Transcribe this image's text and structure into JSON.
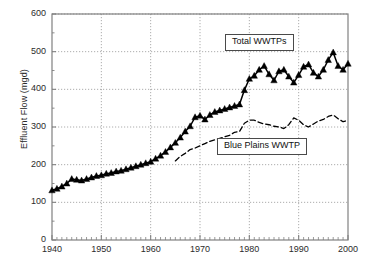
{
  "chart_data": {
    "type": "line",
    "title": "",
    "xlabel": "",
    "ylabel": "Effluent Flow (mgd)",
    "xlim": [
      1940,
      2000
    ],
    "ylim": [
      0,
      600
    ],
    "grid": true,
    "legend_position": "inline-annotations",
    "x_ticks": [
      1940,
      1950,
      1960,
      1970,
      1980,
      1990,
      2000
    ],
    "x_tick_labels": [
      "1940",
      "1950",
      "1960",
      "1970",
      "1980",
      "1990",
      "2000"
    ],
    "x_minor_tick_interval": 1,
    "y_ticks": [
      0,
      100,
      200,
      300,
      400,
      500,
      600
    ],
    "y_tick_labels": [
      "0",
      "100",
      "200",
      "300",
      "400",
      "500",
      "600"
    ],
    "y_minor_tick_interval": 50,
    "series": [
      {
        "name": "Total WWTPs",
        "marker": "filled-triangle",
        "linestyle": "solid",
        "color": "#000000",
        "annotation_label": "Total WWTPs",
        "x": [
          1940,
          1941,
          1942,
          1943,
          1944,
          1945,
          1946,
          1947,
          1948,
          1949,
          1950,
          1951,
          1952,
          1953,
          1954,
          1955,
          1956,
          1957,
          1958,
          1959,
          1960,
          1961,
          1962,
          1963,
          1964,
          1965,
          1966,
          1967,
          1968,
          1969,
          1970,
          1971,
          1972,
          1973,
          1974,
          1975,
          1976,
          1977,
          1978,
          1979,
          1980,
          1981,
          1982,
          1983,
          1984,
          1985,
          1986,
          1987,
          1988,
          1989,
          1990,
          1991,
          1992,
          1993,
          1994,
          1995,
          1996,
          1997,
          1998,
          1999,
          2000
        ],
        "values": [
          132,
          136,
          142,
          150,
          162,
          160,
          158,
          162,
          166,
          170,
          172,
          176,
          178,
          182,
          184,
          188,
          192,
          196,
          200,
          204,
          208,
          216,
          224,
          234,
          246,
          258,
          272,
          288,
          302,
          326,
          330,
          320,
          332,
          340,
          344,
          348,
          352,
          356,
          360,
          398,
          428,
          436,
          452,
          462,
          440,
          424,
          448,
          452,
          434,
          418,
          438,
          460,
          466,
          444,
          434,
          452,
          478,
          498,
          462,
          452,
          468
        ]
      },
      {
        "name": "Blue Plains WWTP",
        "marker": "none",
        "linestyle": "dashed",
        "color": "#000000",
        "annotation_label": "Blue Plains WWTP",
        "x": [
          1965,
          1966,
          1967,
          1968,
          1969,
          1970,
          1971,
          1972,
          1973,
          1974,
          1975,
          1976,
          1977,
          1978,
          1979,
          1980,
          1981,
          1982,
          1983,
          1984,
          1985,
          1986,
          1987,
          1988,
          1989,
          1990,
          1991,
          1992,
          1993,
          1994,
          1995,
          1996,
          1997,
          1998,
          1999,
          2000
        ],
        "values": [
          210,
          222,
          230,
          240,
          244,
          250,
          256,
          262,
          266,
          270,
          274,
          278,
          286,
          288,
          310,
          318,
          318,
          312,
          308,
          306,
          302,
          300,
          296,
          306,
          324,
          318,
          306,
          300,
          308,
          316,
          320,
          328,
          332,
          322,
          314,
          318
        ]
      }
    ],
    "annotations": [
      {
        "name": "total-wwtps-label",
        "text": "Total WWTPs",
        "x": 1984,
        "y": 525
      },
      {
        "name": "blue-plains-label",
        "text": "Blue Plains WWTP",
        "x": 1984,
        "y": 250
      }
    ]
  },
  "colors": {
    "axis": "#808080",
    "grid": "#8a8a8a",
    "data": "#000000",
    "text": "#2b2b2b",
    "annotation_border": "#4a4a4a",
    "background": "#ffffff"
  }
}
